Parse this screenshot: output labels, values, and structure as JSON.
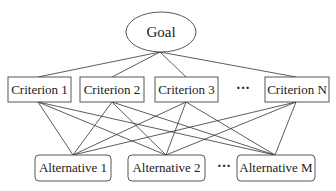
{
  "diagram": {
    "type": "hierarchy",
    "goal": {
      "label": "Goal"
    },
    "criteria": [
      {
        "label": "Criterion 1"
      },
      {
        "label": "Criterion 2"
      },
      {
        "label": "Criterion 3"
      },
      {
        "label": "Criterion N"
      }
    ],
    "criteria_ellipsis": "···",
    "alternatives": [
      {
        "label": "Alternative 1"
      },
      {
        "label": "Alternative 2"
      },
      {
        "label": "Alternative M"
      }
    ],
    "alternatives_ellipsis": "···",
    "edges": {
      "goal_to_criteria": [
        "Criterion 1",
        "Criterion 2",
        "Criterion 3",
        "Criterion N"
      ],
      "criteria_to_alternatives": "all-to-all"
    },
    "colors": {
      "stroke": "#444444",
      "text": "#222222",
      "background": "#ffffff"
    }
  }
}
